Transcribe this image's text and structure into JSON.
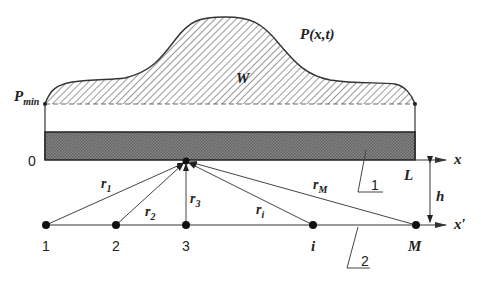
{
  "labels": {
    "pressure_curve": "P(x,t)",
    "area": "W",
    "p_min_main": "P",
    "p_min_sub": "min",
    "origin": "0",
    "x_axis": "x",
    "x_prime_axis": "x′",
    "length": "L",
    "height": "h",
    "callout_1": "1",
    "callout_2": "2"
  },
  "rays": [
    {
      "main": "r",
      "sub": "1"
    },
    {
      "main": "r",
      "sub": "2"
    },
    {
      "main": "r",
      "sub": "3"
    },
    {
      "main": "r",
      "sub": "i"
    },
    {
      "main": "r",
      "sub": "M"
    }
  ],
  "points": [
    {
      "label": "1"
    },
    {
      "label": "2"
    },
    {
      "label": "3"
    },
    {
      "label": "i"
    },
    {
      "label": "M"
    }
  ],
  "colors": {
    "line": "#333333",
    "hatch": "#9a9a9a",
    "bar_fill": "#7a7a7a",
    "background": "#ffffff"
  }
}
